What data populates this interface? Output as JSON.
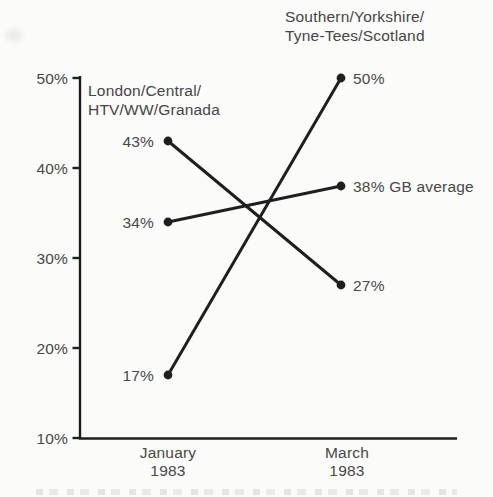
{
  "chart_data": {
    "type": "line",
    "subtype": "slope",
    "categories": [
      "January 1983",
      "March 1983"
    ],
    "x_tick_lines": [
      [
        "January",
        "1983"
      ],
      [
        "March",
        "1983"
      ]
    ],
    "ylim": [
      10,
      50
    ],
    "ytick_values": [
      50,
      40,
      30,
      20,
      10
    ],
    "ytick_labels": [
      "50%",
      "40%",
      "30%",
      "20%",
      "10%"
    ],
    "grid": false,
    "legend": "inline-annotations",
    "series": [
      {
        "name": "London/Central/HTV/WW/Granada",
        "values": [
          43,
          27
        ],
        "point_labels": [
          "43%",
          "27%"
        ]
      },
      {
        "name": "Southern/Yorkshire/Tyne-Tees/Scotland",
        "values": [
          17,
          50
        ],
        "point_labels": [
          "17%",
          "50%"
        ]
      },
      {
        "name": "GB average",
        "values": [
          34,
          38
        ],
        "point_labels": [
          "34%",
          "38% GB average"
        ]
      }
    ],
    "annotations": {
      "left_group_label": [
        "London/Central/",
        "HTV/WW/Granada"
      ],
      "right_group_label": [
        "Southern/Yorkshire/",
        "Tyne-Tees/Scotland"
      ]
    }
  },
  "colors": {
    "ink": "#1f1f1f",
    "label_text": "#484848",
    "background": "#fbfbf9"
  }
}
